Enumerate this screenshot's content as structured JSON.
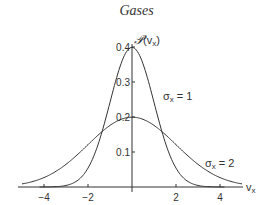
{
  "page": {
    "title": "Gases"
  },
  "chart_data": {
    "type": "line",
    "title": "Gases",
    "xlabel": "v_x",
    "ylabel": "P(v_x)",
    "xlim": [
      -5,
      5
    ],
    "ylim": [
      0,
      0.4
    ],
    "xticks": [
      "−4",
      "−2",
      "2",
      "4"
    ],
    "yticks": [
      "0.1",
      "0.2",
      "0.3",
      "0.4"
    ],
    "series": [
      {
        "name": "σx = 1",
        "function": "gaussian",
        "mean": 0,
        "sigma": 1,
        "peak": 0.399
      },
      {
        "name": "σx = 2",
        "function": "gaussian",
        "mean": 0,
        "sigma": 2,
        "peak": 0.199
      }
    ],
    "annotations": [
      "σx = 1",
      "σx = 2"
    ],
    "grid": false,
    "legend": "inline labels"
  }
}
